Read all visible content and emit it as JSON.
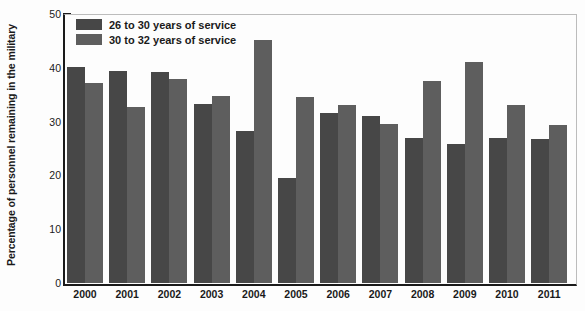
{
  "chart_data": {
    "type": "bar",
    "title": "",
    "xlabel": "",
    "ylabel": "Percentage of personnel remaining in the military",
    "ylim": [
      0,
      50
    ],
    "yticks": [
      0,
      10,
      20,
      30,
      40,
      50
    ],
    "grid": false,
    "legend_position": "top-left",
    "categories": [
      "2000",
      "2001",
      "2002",
      "2003",
      "2004",
      "2005",
      "2006",
      "2007",
      "2008",
      "2009",
      "2010",
      "2011"
    ],
    "series": [
      {
        "name": "26 to 30 years of service",
        "color": "#474747",
        "values": [
          40.1,
          39.5,
          39.2,
          33.3,
          28.3,
          19.6,
          31.6,
          31.1,
          27.0,
          25.8,
          27.0,
          26.7
        ]
      },
      {
        "name": "30 to 32 years of service",
        "color": "#5e5e5e",
        "values": [
          37.2,
          32.7,
          37.9,
          34.8,
          45.2,
          34.6,
          33.0,
          29.5,
          37.6,
          41.0,
          33.0,
          29.4
        ]
      }
    ]
  },
  "axes": {
    "y_title": "Percentage of personnel remaining in the military"
  },
  "colors": {
    "series_a": "#474747",
    "series_b": "#5e5e5e",
    "axis": "#1a1a1a",
    "frame": "#bcbcbc",
    "background": "#fdfdfd"
  }
}
